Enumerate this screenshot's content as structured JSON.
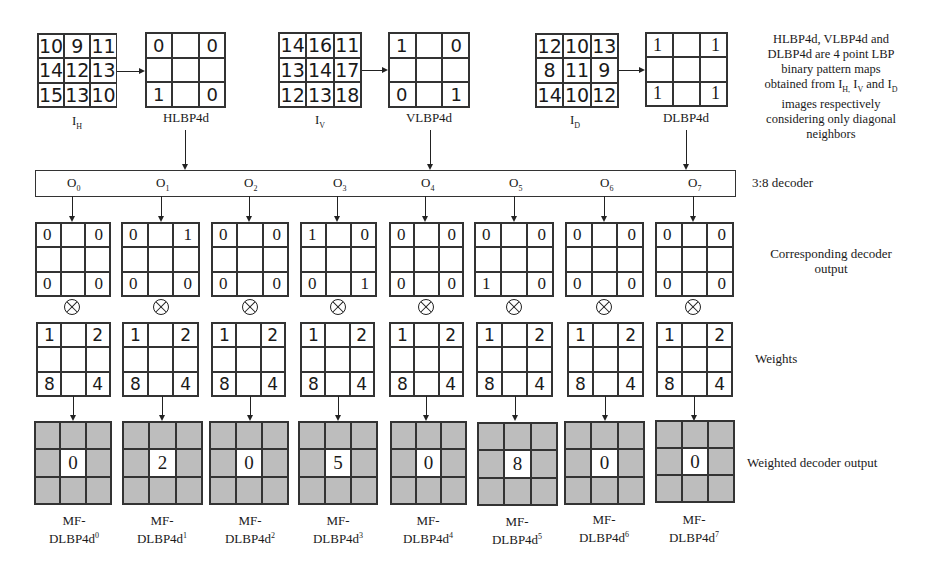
{
  "top_row": {
    "inputs": [
      {
        "name": "I_H",
        "label_main": "I",
        "label_sub": "H",
        "values": [
          [
            "10",
            "9",
            "11"
          ],
          [
            "14",
            "12",
            "13"
          ],
          [
            "15",
            "13",
            "10"
          ]
        ]
      },
      {
        "name": "I_V",
        "label_main": "I",
        "label_sub": "V",
        "values": [
          [
            "14",
            "16",
            "11"
          ],
          [
            "13",
            "14",
            "17"
          ],
          [
            "12",
            "13",
            "18"
          ]
        ]
      },
      {
        "name": "I_D",
        "label_main": "I",
        "label_sub": "D",
        "values": [
          [
            "12",
            "10",
            "13"
          ],
          [
            "8",
            "11",
            "9"
          ],
          [
            "14",
            "10",
            "12"
          ]
        ]
      }
    ],
    "lbp_maps": [
      {
        "label": "HLBP4d",
        "values": [
          [
            "0",
            "",
            "0"
          ],
          [
            "",
            "",
            ""
          ],
          [
            "1",
            "",
            "0"
          ]
        ]
      },
      {
        "label": "VLBP4d",
        "values": [
          [
            "1",
            "",
            "0"
          ],
          [
            "",
            "",
            ""
          ],
          [
            "0",
            "",
            "1"
          ]
        ]
      },
      {
        "label": "DLBP4d",
        "values": [
          [
            "1",
            "",
            "1"
          ],
          [
            "",
            "",
            ""
          ],
          [
            "1",
            "",
            "1"
          ]
        ]
      }
    ],
    "note": {
      "line1": "HLBP4d, VLBP4d and",
      "line2": "DLBP4d are 4 point LBP",
      "line3": "binary pattern maps",
      "line4_prefix": "obtained from I",
      "line4_sub1": "H,",
      "line4_mid1": " I",
      "line4_sub2": "V",
      "line4_mid2": " and I",
      "line4_sub3": "D",
      "line5": "images respectively",
      "line6": "considering only diagonal",
      "line7": "neighbors"
    }
  },
  "decoder": {
    "label": "3:8 decoder",
    "outputs": [
      {
        "main": "O",
        "sub": "0"
      },
      {
        "main": "O",
        "sub": "1"
      },
      {
        "main": "O",
        "sub": "2"
      },
      {
        "main": "O",
        "sub": "3"
      },
      {
        "main": "O",
        "sub": "4"
      },
      {
        "main": "O",
        "sub": "5"
      },
      {
        "main": "O",
        "sub": "6"
      },
      {
        "main": "O",
        "sub": "7"
      }
    ]
  },
  "decoder_outputs": {
    "label_line1": "Corresponding decoder",
    "label_line2": "output",
    "grids": [
      {
        "tl": "0",
        "tr": "0",
        "bl": "0",
        "br": "0"
      },
      {
        "tl": "0",
        "tr": "1",
        "bl": "0",
        "br": "0"
      },
      {
        "tl": "0",
        "tr": "0",
        "bl": "0",
        "br": "0"
      },
      {
        "tl": "1",
        "tr": "0",
        "bl": "0",
        "br": "1"
      },
      {
        "tl": "0",
        "tr": "0",
        "bl": "0",
        "br": "0"
      },
      {
        "tl": "0",
        "tr": "0",
        "bl": "1",
        "br": "0"
      },
      {
        "tl": "0",
        "tr": "0",
        "bl": "0",
        "br": "0"
      },
      {
        "tl": "0",
        "tr": "0",
        "bl": "0",
        "br": "0"
      }
    ]
  },
  "weights": {
    "label": "Weights",
    "grid": {
      "tl": "1",
      "tr": "2",
      "bl": "8",
      "br": "4"
    }
  },
  "weighted_outputs": {
    "label": "Weighted decoder output",
    "items": [
      {
        "value": "0",
        "name_line1": "MF-",
        "name_line2": "DLBP4d",
        "sup": "0"
      },
      {
        "value": "2",
        "name_line1": "MF-",
        "name_line2": "DLBP4d",
        "sup": "1"
      },
      {
        "value": "0",
        "name_line1": "MF-",
        "name_line2": "DLBP4d",
        "sup": "2"
      },
      {
        "value": "5",
        "name_line1": "MF-",
        "name_line2": "DLBP4d",
        "sup": "3"
      },
      {
        "value": "0",
        "name_line1": "MF-",
        "name_line2": "DLBP4d",
        "sup": "4"
      },
      {
        "value": "8",
        "name_line1": "MF-",
        "name_line2": "DLBP4d",
        "sup": "5"
      },
      {
        "value": "0",
        "name_line1": "MF-",
        "name_line2": "DLBP4d",
        "sup": "6"
      },
      {
        "value": "0",
        "name_line1": "MF-",
        "name_line2": "DLBP4d",
        "sup": "7"
      }
    ]
  },
  "colors": {
    "line": "#222222",
    "output_cell_gray": "#bdbdbd",
    "background": "#ffffff"
  }
}
